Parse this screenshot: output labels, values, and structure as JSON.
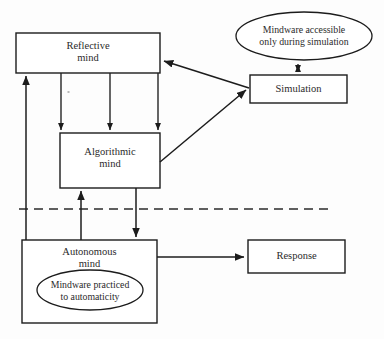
{
  "figure": {
    "background_color": "#fdfdfd",
    "line_color": "#1c1c1c",
    "text_color": "#2a2a2a"
  },
  "nodes": {
    "reflective_mind": {
      "label": "Reflective\nmind",
      "shape": "rectangle",
      "x": 16,
      "y": 33,
      "width": 144,
      "height": 40
    },
    "algorithmic_mind": {
      "label": "Algorithmic\nmind",
      "shape": "rectangle",
      "x": 60,
      "y": 133,
      "width": 100,
      "height": 55
    },
    "autonomous_mind": {
      "label": "Autonomous\nmind",
      "shape": "rectangle",
      "x": 22,
      "y": 240,
      "width": 135,
      "height": 83
    },
    "simulation": {
      "label": "Simulation",
      "shape": "rectangle",
      "x": 250,
      "y": 75,
      "width": 97,
      "height": 28
    },
    "response": {
      "label": "Response",
      "shape": "rectangle",
      "x": 248,
      "y": 240,
      "width": 97,
      "height": 33
    },
    "mindware_accessible": {
      "label": "Mindware accessible\nonly during simulation",
      "shape": "ellipse",
      "cx": 304,
      "cy": 36,
      "rx": 68,
      "ry": 24
    },
    "mindware_practiced": {
      "label": "Mindware practiced\nto automaticity",
      "shape": "ellipse",
      "cx": 90,
      "cy": 290,
      "rx": 53,
      "ry": 20
    }
  },
  "divider": {
    "name": "type-1-type-2-dashed-divider",
    "style": "dashed",
    "x1": 19,
    "y1": 209,
    "x2": 330,
    "y2": 209
  },
  "connections": [
    {
      "name": "autonomous-to-reflective",
      "from": "autonomous_mind",
      "to": "reflective_mind",
      "arrow": "single",
      "direction": "up"
    },
    {
      "name": "reflective-to-algorithmic-left",
      "from": "reflective_mind",
      "to": "algorithmic_mind",
      "arrow": "single",
      "direction": "down"
    },
    {
      "name": "reflective-to-algorithmic-middle",
      "from": "reflective_mind",
      "to": "algorithmic_mind",
      "arrow": "single",
      "direction": "down"
    },
    {
      "name": "reflective-to-algorithmic-right",
      "from": "reflective_mind",
      "to": "algorithmic_mind",
      "arrow": "single",
      "direction": "down"
    },
    {
      "name": "autonomous-to-algorithmic",
      "from": "autonomous_mind",
      "to": "algorithmic_mind",
      "arrow": "single",
      "direction": "up"
    },
    {
      "name": "algorithmic-to-autonomous",
      "from": "algorithmic_mind",
      "to": "autonomous_mind",
      "arrow": "single",
      "direction": "down"
    },
    {
      "name": "simulation-to-reflective",
      "from": "simulation",
      "to": "reflective_mind",
      "arrow": "single",
      "direction": "diagonal-up-left"
    },
    {
      "name": "algorithmic-to-simulation",
      "from": "algorithmic_mind",
      "to": "simulation",
      "arrow": "single",
      "direction": "diagonal-up-right"
    },
    {
      "name": "mindware-simulation-bidirectional",
      "from": "mindware_accessible",
      "to": "simulation",
      "arrow": "double",
      "direction": "vertical"
    },
    {
      "name": "autonomous-to-response",
      "from": "autonomous_mind",
      "to": "response",
      "arrow": "single",
      "direction": "right"
    }
  ]
}
